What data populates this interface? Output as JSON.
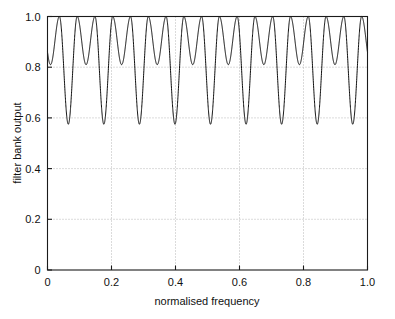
{
  "chart_data": {
    "type": "line",
    "title": "",
    "subtitle": "",
    "xlabel": "normalised frequency",
    "ylabel": "filter bank output",
    "xlim": [
      0,
      1.0
    ],
    "ylim": [
      0,
      1.0
    ],
    "grid": true,
    "legend": null,
    "legend_position": "none",
    "line_color": "#000000",
    "xticks": [
      0,
      0.2,
      0.4,
      0.6,
      0.8,
      1.0
    ],
    "xticklabels": [
      "0",
      "0.2",
      "0.4",
      "0.6",
      "0.8",
      "1.0"
    ],
    "yticks": [
      0,
      0.2,
      0.4,
      0.6,
      0.8,
      1.0
    ],
    "yticklabels": [
      "0",
      "0.2",
      "0.4",
      "0.6",
      "0.8",
      "1.0"
    ],
    "series": [
      {
        "name": "filter bank output",
        "peak_value": 1.0,
        "shallow_minimum": 0.81,
        "deep_minimum": 0.575,
        "ripple_count": 18,
        "deep_dip_count": 9,
        "deep_dip_x": [
          0.065,
          0.176,
          0.287,
          0.398,
          0.509,
          0.62,
          0.731,
          0.842,
          0.953
        ],
        "shallow_dip_x": [
          0.0095,
          0.1205,
          0.2315,
          0.3425,
          0.4535,
          0.5645,
          0.6755,
          0.7865,
          0.8975
        ],
        "peak_x": [
          0.0373,
          0.0928,
          0.1483,
          0.2038,
          0.2593,
          0.3148,
          0.3703,
          0.4258,
          0.4813,
          0.5368,
          0.5923,
          0.6478,
          0.7033,
          0.7588,
          0.8143,
          0.8698,
          0.9253,
          0.9808
        ]
      }
    ]
  },
  "figure": {
    "background_color": "#ffffff",
    "axes_color": "#1a1a1a",
    "grid_color": "#9a9a9a",
    "width": 395,
    "height": 319
  }
}
